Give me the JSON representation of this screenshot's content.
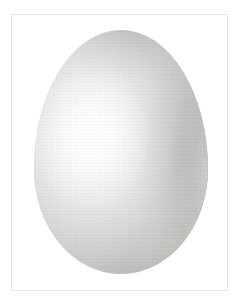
{
  "image": {
    "kind": "photograph",
    "subject_name": "egg",
    "subject_caption": "Egg",
    "orientation": "vertical",
    "width_px": 244,
    "height_px": 308
  },
  "canvas": {
    "background_color": "#ffffff"
  },
  "frame": {
    "name": "plate-border",
    "border_color": "#e9e9e9",
    "fill_color": "#ffffff",
    "left_px": 11,
    "top_px": 14,
    "width_px": 217,
    "height_px": 277
  },
  "subject": {
    "shape": "ovoid",
    "label": "egg",
    "left_px": 34,
    "top_px": 30,
    "width_px": 174,
    "height_px": 244,
    "center_x_px": 121,
    "center_y_px": 152,
    "base_color": "#c9cac7",
    "highlight_color": "#fdfdfd",
    "midtone_color": "#d8d9d6",
    "shadow_color": "#acadaa",
    "core_shadow_color": "#9fa19d",
    "light_direction": "upper-left",
    "highlight_center": "33% 44%"
  }
}
